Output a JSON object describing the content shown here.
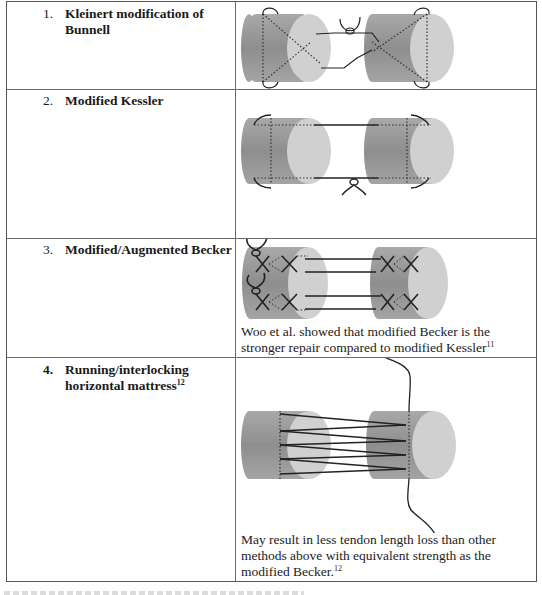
{
  "table": {
    "rows": [
      {
        "number": "1.",
        "title_line1": "Kleinert modification of",
        "title_line2": "Bunnell",
        "figure": "kleinert-bunnell-suture-diagram",
        "note": null
      },
      {
        "number": "2.",
        "title_line1": "Modified Kessler",
        "figure": "modified-kessler-suture-diagram",
        "note": null
      },
      {
        "number": "3.",
        "title_line1": "Modified/Augmented Becker",
        "figure": "modified-becker-suture-diagram",
        "note_line1": "Woo et al. showed that modified Becker is the",
        "note_line2": "stronger repair compared to modified Kessler",
        "note_ref": "11"
      },
      {
        "number": "4.",
        "title_line1": "Running/interlocking",
        "title_line2": "horizontal mattress",
        "title_ref": "12",
        "figure": "running-interlocking-mattress-diagram",
        "note_line1": "May result in less tendon length loss than other",
        "note_line2": "methods above with equivalent strength as the",
        "note_line3": "modified Becker.",
        "note_ref": "12"
      }
    ]
  },
  "colors": {
    "tendon_body": "#9a9a9a",
    "tendon_face": "#d2d2d2",
    "suture": "#222222",
    "border": "#555555"
  }
}
